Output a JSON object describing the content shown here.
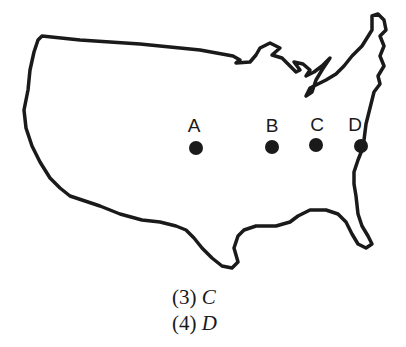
{
  "map": {
    "subject": "Outline map of the contiguous United States",
    "points": [
      {
        "label": "A",
        "x": 196,
        "y": 148
      },
      {
        "label": "B",
        "x": 272,
        "y": 147
      },
      {
        "label": "C",
        "x": 316,
        "y": 145
      },
      {
        "label": "D",
        "x": 361,
        "y": 146
      }
    ]
  },
  "choices": [
    {
      "number": "(3)",
      "answer": "C"
    },
    {
      "number": "(4)",
      "answer": "D"
    }
  ]
}
